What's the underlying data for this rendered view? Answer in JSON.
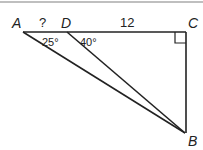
{
  "diagram": {
    "points": {
      "A": {
        "label": "A"
      },
      "D": {
        "label": "D"
      },
      "C": {
        "label": "C"
      },
      "B": {
        "label": "B"
      }
    },
    "segments": {
      "AD": {
        "label": "?"
      },
      "DC": {
        "label": "12"
      }
    },
    "angles": {
      "A": {
        "label": "25°"
      },
      "D": {
        "label": "40°"
      },
      "C": {
        "label": "right-angle"
      }
    }
  }
}
